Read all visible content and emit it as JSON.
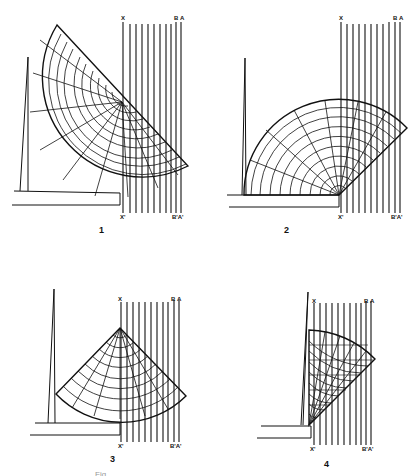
{
  "figure": {
    "panels": [
      {
        "number": "1",
        "labels": {
          "top_x": "X",
          "top_b": "B",
          "top_a": "A",
          "bottom_x": "X'",
          "bottom_ba": "B'A'"
        }
      },
      {
        "number": "2",
        "labels": {
          "top_x": "X",
          "top_b": "B",
          "top_a": "A",
          "bottom_x": "X'",
          "bottom_ba": "B'A'"
        }
      },
      {
        "number": "3",
        "labels": {
          "top_x": "X",
          "top_b": "B",
          "top_a": "A",
          "bottom_x": "X'",
          "bottom_ba": "B'A'"
        }
      },
      {
        "number": "4",
        "labels": {
          "top_x": "X",
          "top_b": "B",
          "top_a": "A",
          "bottom_x": "X'",
          "bottom_ba": "B'A'"
        }
      }
    ],
    "caption": "Fig. . . . . . . . . . . . . . . . . . . . . . . ."
  },
  "colors": {
    "ink": "#111111",
    "paper": "#ffffff"
  }
}
